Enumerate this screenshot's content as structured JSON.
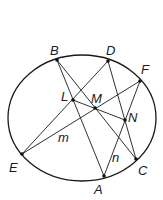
{
  "diagram": {
    "ellipse": {
      "cx": 82,
      "cy": 118,
      "rx": 74,
      "ry": 63
    },
    "points": {
      "B": {
        "x": 57,
        "y": 60,
        "label": "B",
        "lx": 50,
        "ly": 55
      },
      "D": {
        "x": 108,
        "y": 61,
        "label": "D",
        "lx": 106,
        "ly": 55
      },
      "F": {
        "x": 140,
        "y": 81,
        "label": "F",
        "lx": 141,
        "ly": 74
      },
      "L": {
        "x": 73,
        "y": 100,
        "label": "L",
        "lx": 61,
        "ly": 101
      },
      "M": {
        "x": 95,
        "y": 108,
        "label": "M",
        "lx": 91,
        "ly": 103
      },
      "N": {
        "x": 125,
        "y": 120,
        "label": "N",
        "lx": 128,
        "ly": 122
      },
      "E": {
        "x": 22,
        "y": 154,
        "label": "E",
        "lx": 9,
        "ly": 172
      },
      "C": {
        "x": 136,
        "y": 159,
        "label": "C",
        "lx": 138,
        "ly": 175
      },
      "A": {
        "x": 104,
        "y": 176,
        "label": "A",
        "lx": 94,
        "ly": 194
      }
    },
    "line_labels": [
      {
        "text": "m",
        "x": 58,
        "y": 142
      },
      {
        "text": "n",
        "x": 112,
        "y": 162
      }
    ],
    "segments": [
      [
        "B",
        "A"
      ],
      [
        "B",
        "C"
      ],
      [
        "D",
        "E"
      ],
      [
        "D",
        "C"
      ],
      [
        "F",
        "E"
      ],
      [
        "F",
        "A"
      ],
      [
        "L",
        "N"
      ]
    ]
  }
}
